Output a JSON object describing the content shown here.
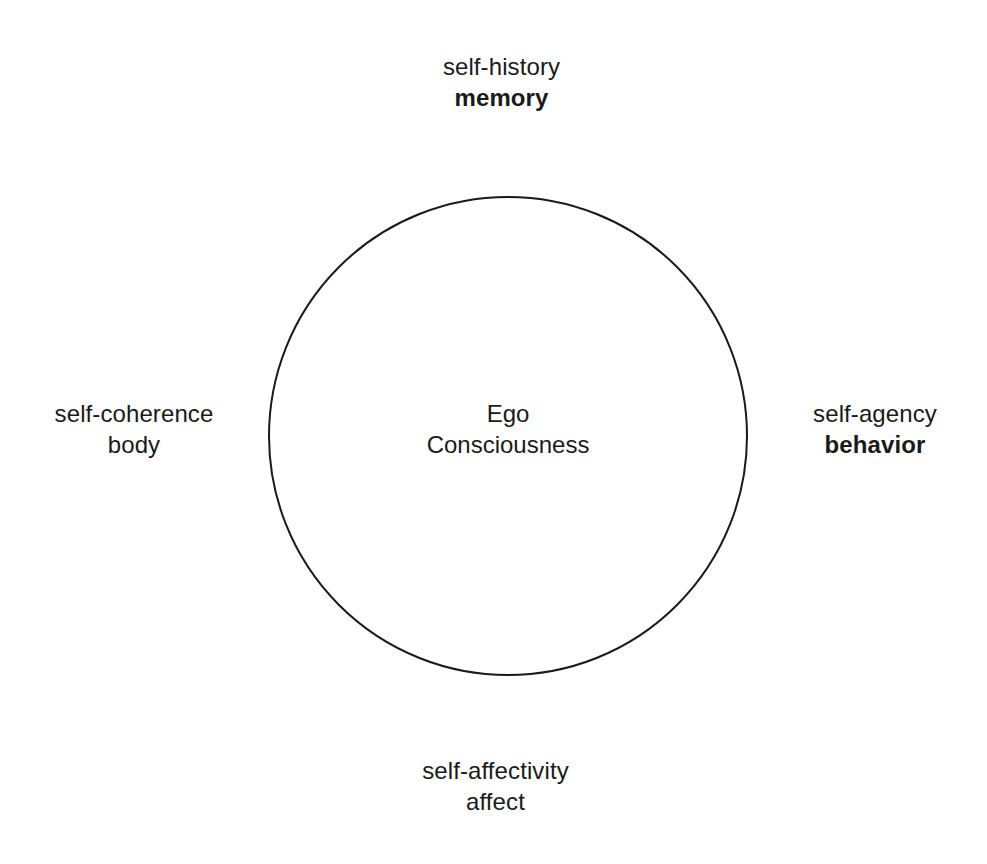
{
  "diagram": {
    "background_color": "#ffffff",
    "stroke_color": "#1a1a1a",
    "text_color": "#1a1a1a",
    "center": {
      "line1": "Ego",
      "line2": "Consciousness"
    },
    "labels": {
      "top": {
        "line1": "self-history",
        "line2": "memory",
        "line2_weight": "bold"
      },
      "right": {
        "line1": "self-agency",
        "line2": "behavior",
        "line2_weight": "bold"
      },
      "bottom": {
        "line1": "self-affectivity",
        "line2": "affect",
        "line2_weight": "normal"
      },
      "left": {
        "line1": "self-coherence",
        "line2": "body",
        "line2_weight": "normal"
      }
    }
  }
}
